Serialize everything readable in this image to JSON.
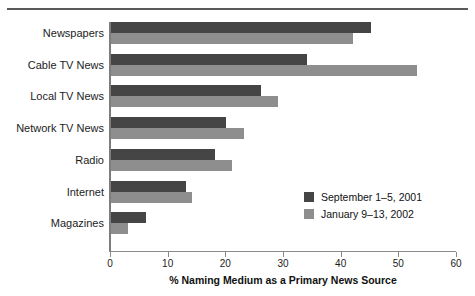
{
  "chart_data": {
    "type": "bar",
    "orientation": "horizontal",
    "title": "",
    "xlabel": "% Naming Medium as a Primary News Source",
    "ylabel": "",
    "xlim": [
      0,
      60
    ],
    "xticks": [
      0,
      10,
      20,
      30,
      40,
      50,
      60
    ],
    "xtick_labels": [
      "0",
      "10",
      "20",
      "30",
      "40",
      "50",
      "60"
    ],
    "grid": false,
    "legend_position": "inside-right",
    "categories": [
      "Newspapers",
      "Cable TV News",
      "Local TV News",
      "Network TV News",
      "Radio",
      "Internet",
      "Magazines"
    ],
    "series": [
      {
        "name": "September 1–5, 2001",
        "color": "#454545",
        "values": [
          45,
          34,
          26,
          20,
          18,
          13,
          6
        ]
      },
      {
        "name": "January 9–13, 2002",
        "color": "#8e8e8e",
        "values": [
          42,
          53,
          29,
          23,
          21,
          14,
          3
        ]
      }
    ]
  },
  "legend": {
    "items": [
      {
        "label": "September 1–5, 2001",
        "color": "#454545"
      },
      {
        "label": "January 9–13, 2002",
        "color": "#8e8e8e"
      }
    ]
  }
}
